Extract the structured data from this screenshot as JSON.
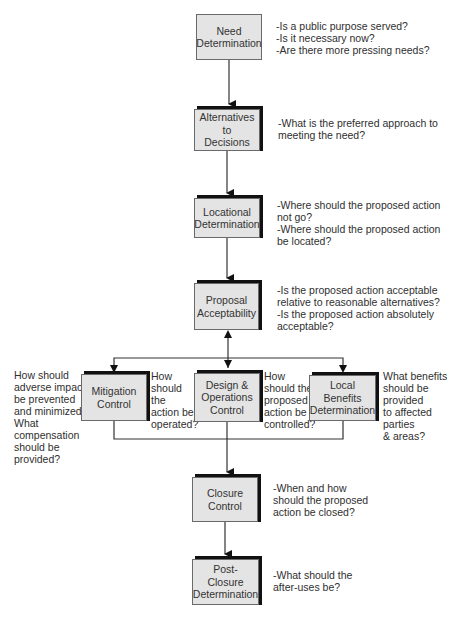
{
  "diagram": {
    "type": "flowchart",
    "nodes": {
      "need": {
        "label": "Need\nDetermination"
      },
      "alternatives": {
        "label": "Alternatives to\nDecisions"
      },
      "locational": {
        "label": "Locational\nDetermination"
      },
      "proposal": {
        "label": "Proposal\nAcceptability"
      },
      "mitigation": {
        "label": "Mitigation\nControl"
      },
      "design": {
        "label": "Design &\nOperations\nControl"
      },
      "local": {
        "label": "Local\nBenefits\nDetermination"
      },
      "closure": {
        "label": "Closure\nControl"
      },
      "post_closure": {
        "label": "Post-\nClosure\nDetermination"
      }
    },
    "notes": {
      "need": "-Is a public purpose served?\n-Is it necessary now?\n-Are there more pressing needs?",
      "alternatives": "-What is the preferred approach to\n meeting the need?",
      "locational": "-Where should the proposed action\n not go?\n-Where should the proposed action\n be located?",
      "proposal": "-Is the proposed action acceptable\n relative to reasonable alternatives?\n-Is the proposed action absolutely\n acceptable?",
      "mitigation": "How should\nadverse impacts\nbe prevented\nand minimized?\nWhat\ncompensation\nshould be\nprovided?",
      "mitigation_side": "How\nshould\nthe\naction be\noperated?",
      "design": "How\nshould the\nproposed\naction be\ncontrolled?",
      "local": "What benefits\nshould be\nprovided\nto affected\nparties\n& areas?",
      "closure": "-When and how\nshould the proposed\naction be closed?",
      "post_closure": "-What should the\nafter-uses be?"
    },
    "edges": [
      [
        "Need Determination",
        "Alternatives to Decisions"
      ],
      [
        "Alternatives to Decisions",
        "Locational Determination"
      ],
      [
        "Locational Determination",
        "Proposal Acceptability"
      ],
      [
        "Proposal Acceptability",
        "Mitigation Control"
      ],
      [
        "Proposal Acceptability",
        "Design & Operations Control"
      ],
      [
        "Proposal Acceptability",
        "Local Benefits Determination"
      ],
      [
        "Control group",
        "Proposal Acceptability"
      ],
      [
        "Control group",
        "Closure Control"
      ],
      [
        "Closure Control",
        "Post-Closure Determination"
      ]
    ]
  }
}
